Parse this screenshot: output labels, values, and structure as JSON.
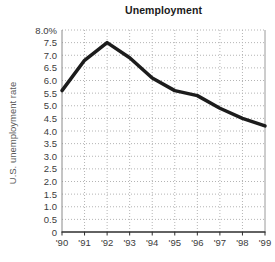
{
  "chart": {
    "title": "Unemployment",
    "ylabel": "U.S. unemployment rate"
  },
  "chart_data": {
    "type": "line",
    "title": "Unemployment",
    "xlabel": "",
    "ylabel": "U.S. unemployment rate",
    "categories": [
      "'90",
      "'91",
      "'92",
      "'93",
      "'94",
      "'95",
      "'96",
      "'97",
      "'98",
      "'99"
    ],
    "values": [
      5.6,
      6.8,
      7.5,
      6.9,
      6.1,
      5.6,
      5.4,
      4.9,
      4.5,
      4.2
    ],
    "ylim": [
      0,
      8
    ],
    "ytick_step": 0.5,
    "y_tick_labels": [
      "8.0%",
      "7.5",
      "7.0",
      "6.5",
      "6.0",
      "5.5",
      "5.0",
      "4.5",
      "4.0",
      "3.5",
      "3.0",
      "2.5",
      "2.0",
      "1.5",
      "1.0",
      "0.5",
      "0"
    ],
    "grid": true,
    "legend": "none",
    "line_color": "#1c1c1c",
    "grid_color": "#b4b4b4",
    "axis_color": "#8a8a8a",
    "bottom_axis_color": "#2e2e2e"
  }
}
